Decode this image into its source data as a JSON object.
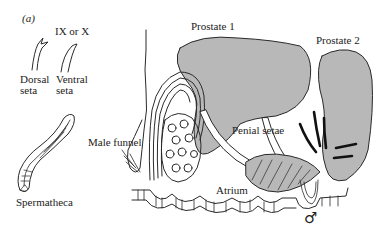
{
  "figure": {
    "panel_label": "(a)",
    "labels": {
      "segment": "IX or X",
      "dorsal_seta": "Dorsal",
      "dorsal_seta_2": "seta",
      "ventral_seta": "Ventral",
      "ventral_seta_2": "seta",
      "spermatheca": "Spermatheca",
      "male_funnel": "Male funnel",
      "prostate_1": "Prostate 1",
      "prostate_2": "Prostate 2",
      "penial_setae": "Penial setae",
      "atrium": "Atrium",
      "male_symbol": "♂"
    },
    "colors": {
      "gland_fill": "#b8b8b8",
      "ink": "#2a2a2a",
      "background": "#ffffff"
    }
  }
}
